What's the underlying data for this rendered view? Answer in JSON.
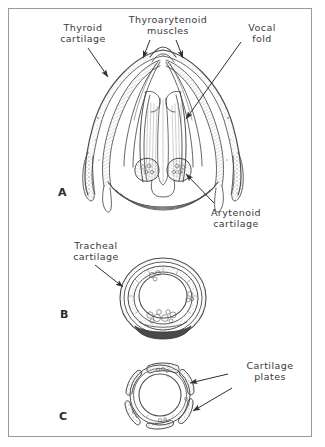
{
  "figure": {
    "background_color": "#ffffff",
    "border_color": "#9a9a9a",
    "ink_color": "#4a4a4a",
    "label_color": "#3a3a3a",
    "type": "anatomical-line-drawing"
  },
  "labels": {
    "thyroid_cartilage": "Thyroid\ncartilage",
    "thyroarytenoid_muscles": "Thyroarytenoid\nmuscles",
    "vocal_fold": "Vocal\nfold",
    "arytenoid_cartilage": "Arytenoid\ncartilage",
    "tracheal_cartilage": "Tracheal\ncartilage",
    "cartilage_plates": "Cartilage\nplates"
  },
  "panels": [
    {
      "letter": "A",
      "caption": "Larynx, posterior coronal view",
      "labels": [
        "Thyroid cartilage",
        "Thyroarytenoid muscles",
        "Vocal fold",
        "Arytenoid cartilage"
      ]
    },
    {
      "letter": "B",
      "caption": "Trachea cross section",
      "labels": [
        "Tracheal cartilage"
      ]
    },
    {
      "letter": "C",
      "caption": "Bronchus cross section",
      "labels": [
        "Cartilage plates"
      ]
    }
  ]
}
